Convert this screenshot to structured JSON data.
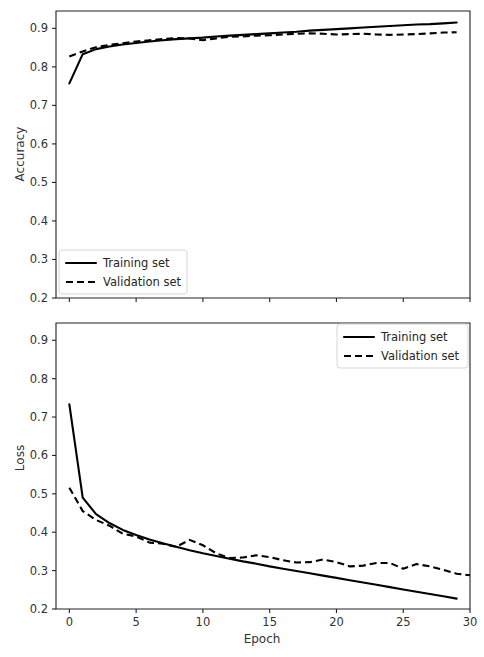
{
  "figure": {
    "background": "#ffffff",
    "line_color": "#000000",
    "axis_color": "#222222"
  },
  "chart_data": [
    {
      "type": "line",
      "id": "accuracy",
      "title": "",
      "xlabel": "",
      "ylabel": "Accuracy",
      "xlim": [
        -1.0,
        30.0
      ],
      "ylim": [
        0.2,
        0.945
      ],
      "xticks": [
        0,
        5,
        10,
        15,
        20,
        25,
        30
      ],
      "xticklabels": [
        "",
        "",
        "",
        "",
        "",
        "",
        ""
      ],
      "yticks": [
        0.2,
        0.3,
        0.4,
        0.5,
        0.6,
        0.7,
        0.8,
        0.9
      ],
      "yticklabels": [
        "0.2",
        "0.3",
        "0.4",
        "0.5",
        "0.6",
        "0.7",
        "0.8",
        "0.9"
      ],
      "grid": false,
      "legend_position": "lower left",
      "x": [
        0,
        1,
        2,
        3,
        4,
        5,
        6,
        7,
        8,
        9,
        10,
        11,
        12,
        13,
        14,
        15,
        16,
        17,
        18,
        19,
        20,
        21,
        22,
        23,
        24,
        25,
        26,
        27,
        28,
        29
      ],
      "series": [
        {
          "name": "Training set",
          "style": "solid",
          "values": [
            0.757,
            0.833,
            0.846,
            0.853,
            0.858,
            0.862,
            0.866,
            0.869,
            0.872,
            0.874,
            0.876,
            0.879,
            0.881,
            0.883,
            0.885,
            0.887,
            0.889,
            0.891,
            0.894,
            0.896,
            0.898,
            0.9,
            0.902,
            0.904,
            0.906,
            0.908,
            0.91,
            0.911,
            0.913,
            0.915
          ]
        },
        {
          "name": "Validation set",
          "style": "dashed",
          "values": [
            0.827,
            0.84,
            0.851,
            0.857,
            0.861,
            0.866,
            0.869,
            0.872,
            0.875,
            0.874,
            0.869,
            0.874,
            0.878,
            0.879,
            0.881,
            0.882,
            0.884,
            0.886,
            0.887,
            0.886,
            0.884,
            0.885,
            0.886,
            0.884,
            0.883,
            0.884,
            0.885,
            0.887,
            0.889,
            0.89
          ]
        }
      ]
    },
    {
      "type": "line",
      "id": "loss",
      "title": "",
      "xlabel": "Epoch",
      "ylabel": "Loss",
      "xlim": [
        -1.0,
        30.0
      ],
      "ylim": [
        0.2,
        0.945
      ],
      "xticks": [
        0,
        5,
        10,
        15,
        20,
        25,
        30
      ],
      "xticklabels": [
        "0",
        "5",
        "10",
        "15",
        "20",
        "25",
        "30"
      ],
      "yticks": [
        0.2,
        0.3,
        0.4,
        0.5,
        0.6,
        0.7,
        0.8,
        0.9
      ],
      "yticklabels": [
        "0.2",
        "0.3",
        "0.4",
        "0.5",
        "0.6",
        "0.7",
        "0.8",
        "0.9"
      ],
      "grid": false,
      "legend_position": "upper right",
      "x": [
        0,
        1,
        2,
        3,
        4,
        5,
        6,
        7,
        8,
        9,
        10,
        11,
        12,
        13,
        14,
        15,
        16,
        17,
        18,
        19,
        20,
        21,
        22,
        23,
        24,
        25,
        26,
        27,
        28,
        29
      ],
      "series": [
        {
          "name": "Training set",
          "style": "solid",
          "values": [
            0.733,
            0.49,
            0.447,
            0.424,
            0.406,
            0.393,
            0.381,
            0.371,
            0.362,
            0.353,
            0.345,
            0.338,
            0.331,
            0.324,
            0.318,
            0.311,
            0.305,
            0.299,
            0.293,
            0.287,
            0.281,
            0.275,
            0.269,
            0.263,
            0.257,
            0.251,
            0.245,
            0.239,
            0.233,
            0.227
          ]
        },
        {
          "name": "Validation set",
          "style": "dashed",
          "values": [
            0.516,
            0.455,
            0.432,
            0.417,
            0.396,
            0.389,
            0.373,
            0.37,
            0.362,
            0.38,
            0.366,
            0.345,
            0.333,
            0.334,
            0.34,
            0.335,
            0.327,
            0.321,
            0.322,
            0.329,
            0.322,
            0.311,
            0.313,
            0.32,
            0.32,
            0.305,
            0.317,
            0.311,
            0.302,
            0.292,
            0.288
          ]
        }
      ]
    }
  ],
  "panels": {
    "accuracy": {
      "ylabel": "Accuracy",
      "legend": {
        "training_label": "Training set",
        "validation_label": "Validation set"
      }
    },
    "loss": {
      "ylabel": "Loss",
      "xlabel": "Epoch",
      "legend": {
        "training_label": "Training set",
        "validation_label": "Validation set"
      }
    }
  }
}
